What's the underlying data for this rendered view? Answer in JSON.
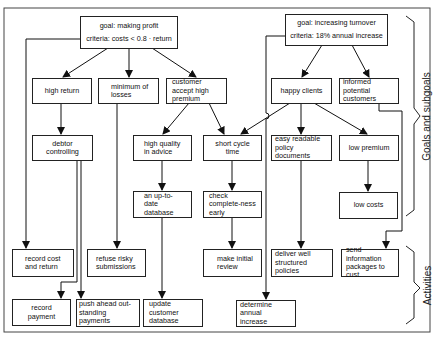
{
  "diagram": {
    "type": "goal-activity hierarchy",
    "goals": [
      {
        "id": "g1",
        "title": "goal: making profit",
        "criteria": "criteria: costs < 0.8 · return"
      },
      {
        "id": "g2",
        "title": "goal: increasing turnover",
        "criteria": "criteria: 18% annual increase"
      }
    ],
    "subgoals": [
      {
        "id": "s1",
        "label": "high return"
      },
      {
        "id": "s2",
        "label": "minimum of losses"
      },
      {
        "id": "s3",
        "label": "customer accept high premium"
      },
      {
        "id": "s4",
        "label": "happy clients"
      },
      {
        "id": "s5",
        "label": "informed potential customers"
      },
      {
        "id": "s6",
        "label": "debtor controlling"
      },
      {
        "id": "s7",
        "label": "high quality in advice"
      },
      {
        "id": "s8",
        "label": "short cycle time"
      },
      {
        "id": "s9",
        "label": "easy readable policy documents"
      },
      {
        "id": "s10",
        "label": "low premium"
      },
      {
        "id": "s11",
        "label": "an up-to-date database"
      },
      {
        "id": "s12",
        "label": "check complete-ness early"
      },
      {
        "id": "s13",
        "label": "low costs"
      }
    ],
    "activities": [
      {
        "id": "a1",
        "label": "record cost and return"
      },
      {
        "id": "a2",
        "label": "refuse risky submissions"
      },
      {
        "id": "a3",
        "label": "make initial review"
      },
      {
        "id": "a4",
        "label": "deliver well structured policies"
      },
      {
        "id": "a5",
        "label": "send information packages to cust."
      },
      {
        "id": "a6",
        "label": "record payment"
      },
      {
        "id": "a7",
        "label": "push ahead out-standing payments"
      },
      {
        "id": "a8",
        "label": "update customer database"
      },
      {
        "id": "a9",
        "label": "determine annual increase"
      }
    ],
    "edges": [
      [
        "g1",
        "s1"
      ],
      [
        "g1",
        "s2"
      ],
      [
        "g1",
        "s3"
      ],
      [
        "g1",
        "a1"
      ],
      [
        "g2",
        "s4"
      ],
      [
        "g2",
        "s5"
      ],
      [
        "g2",
        "a9"
      ],
      [
        "s1",
        "s6"
      ],
      [
        "s6",
        "a6"
      ],
      [
        "s6",
        "a7"
      ],
      [
        "s2",
        "a2"
      ],
      [
        "s3",
        "s7"
      ],
      [
        "s3",
        "s8"
      ],
      [
        "s4",
        "s8"
      ],
      [
        "s4",
        "s9"
      ],
      [
        "s4",
        "s10"
      ],
      [
        "s5",
        "a5"
      ],
      [
        "s7",
        "s11"
      ],
      [
        "s11",
        "a8"
      ],
      [
        "s8",
        "s12"
      ],
      [
        "s12",
        "a3"
      ],
      [
        "s9",
        "a4"
      ],
      [
        "s10",
        "s13"
      ]
    ],
    "side_labels": {
      "goals": "Goals and subgoals",
      "activities": "Activities"
    }
  },
  "nodes": {
    "g1_title": "goal: making profit",
    "g1_criteria": "criteria: costs < 0.8 · return",
    "g2_title": "goal: increasing turnover",
    "g2_criteria": "criteria: 18% annual increase",
    "high_return": "high return",
    "minimum_losses": "minimum of losses",
    "customer_accept": "customer accept high premium",
    "happy_clients": "happy clients",
    "informed_customers": "informed potential customers",
    "debtor_controlling": "debtor controlling",
    "high_quality": "high quality in advice",
    "short_cycle": "short cycle time",
    "easy_readable": "easy readable policy documents",
    "low_premium": "low premium",
    "uptodate_db": "an up-to-date database",
    "check_complete": "check complete-ness early",
    "low_costs": "low costs",
    "record_cost": "record cost and return",
    "refuse_risky": "refuse risky submissions",
    "make_review": "make initial review",
    "deliver_policies": "deliver well structured policies",
    "send_info": "send information packages to cust.",
    "record_payment": "record payment",
    "push_ahead": "push ahead out-standing payments",
    "update_db": "update customer database",
    "determine_increase": "determine annual increase",
    "label_goals": "Goals and subgoals",
    "label_activities": "Activities"
  }
}
